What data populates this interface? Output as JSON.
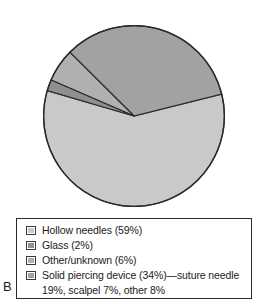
{
  "figure": {
    "panel_letter": "B",
    "background_color": "#ffffff",
    "outline_color": "#2b2b2b"
  },
  "chart_data": {
    "type": "pie",
    "title": "",
    "xlabel": "",
    "ylabel": "",
    "legend_position": "bottom",
    "grid": false,
    "start_angle_deg": -14,
    "direction": "clockwise",
    "categories": [
      "Hollow needles",
      "Glass",
      "Other/unknown",
      "Solid piercing device"
    ],
    "values": [
      59,
      2,
      6,
      34
    ],
    "unit": "%",
    "colors": [
      "#c9c9c9",
      "#8f8f8f",
      "#b0b0b0",
      "#a2a2a2"
    ],
    "slices": [
      {
        "label": "Hollow needles",
        "value": 59,
        "color": "#c9c9c9"
      },
      {
        "label": "Glass",
        "value": 2,
        "color": "#8f8f8f"
      },
      {
        "label": "Other/unknown",
        "value": 6,
        "color": "#b0b0b0"
      },
      {
        "label": "Solid piercing device",
        "value": 34,
        "color": "#a2a2a2"
      }
    ]
  },
  "legend": {
    "items": [
      {
        "label": "Hollow needles (59%)",
        "color": "#c9c9c9"
      },
      {
        "label": "Glass (2%)",
        "color": "#8f8f8f"
      },
      {
        "label": "Other/unknown (6%)",
        "color": "#b0b0b0"
      },
      {
        "label": "Solid piercing device (34%)—suture needle",
        "color": "#a2a2a2"
      }
    ],
    "continuation_line": "19%, scalpel 7%, other 8%"
  }
}
